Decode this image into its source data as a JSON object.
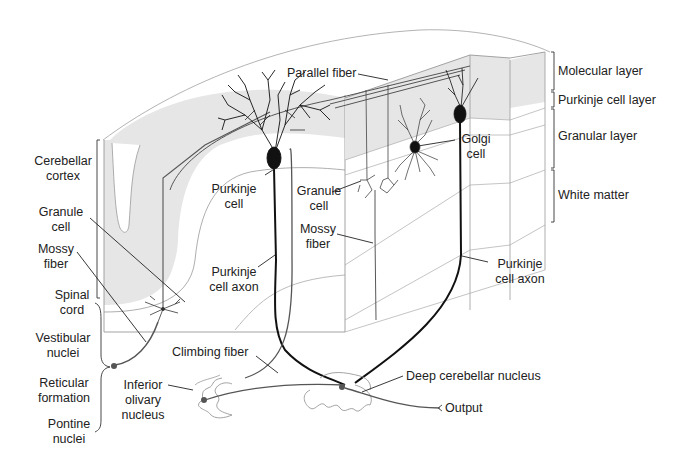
{
  "diagram": {
    "colors": {
      "background": "#ffffff",
      "molecular_layer_fill": "#e6e6e6",
      "outline": "#9a9a9a",
      "neuron": "#111111",
      "fiber_gray": "#555555",
      "text": "#222222"
    },
    "layer_labels": {
      "molecular": "Molecular layer",
      "purkinje": "Purkinje cell layer",
      "granular": "Granular layer",
      "white_matter": "White matter"
    },
    "labels": {
      "parallel_fiber": "Parallel fiber",
      "cerebellar_cortex_1": "Cerebellar",
      "cerebellar_cortex_2": "cortex",
      "granule_cell_left_1": "Granule",
      "granule_cell_left_2": "cell",
      "mossy_fiber_left_1": "Mossy",
      "mossy_fiber_left_2": "fiber",
      "purkinje_cell_1": "Purkinje",
      "purkinje_cell_2": "cell",
      "granule_cell_mid_1": "Granule",
      "granule_cell_mid_2": "cell",
      "mossy_fiber_mid_1": "Mossy",
      "mossy_fiber_mid_2": "fiber",
      "golgi_cell_1": "Golgi",
      "golgi_cell_2": "cell",
      "purkinje_axon_left_1": "Purkinje",
      "purkinje_axon_left_2": "cell axon",
      "purkinje_axon_right_1": "Purkinje",
      "purkinje_axon_right_2": "cell axon",
      "spinal_cord_1": "Spinal",
      "spinal_cord_2": "cord",
      "vestibular_nuclei_1": "Vestibular",
      "vestibular_nuclei_2": "nuclei",
      "reticular_formation_1": "Reticular",
      "reticular_formation_2": "formation",
      "pontine_nuclei_1": "Pontine",
      "pontine_nuclei_2": "nuclei",
      "climbing_fiber": "Climbing fiber",
      "inferior_olivary_1": "Inferior",
      "inferior_olivary_2": "olivary",
      "inferior_olivary_3": "nucleus",
      "deep_cerebellar_nucleus": "Deep cerebellar nucleus",
      "output": "Output"
    }
  }
}
